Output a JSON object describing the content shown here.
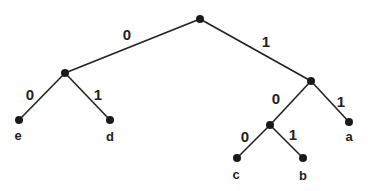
{
  "diagram": {
    "type": "binary-code-tree",
    "nodes": {
      "root": {
        "x": 200,
        "y": 19
      },
      "n0": {
        "x": 65,
        "y": 73
      },
      "n1": {
        "x": 311,
        "y": 81
      },
      "n10": {
        "x": 270,
        "y": 125
      },
      "e": {
        "x": 19,
        "y": 120,
        "label": "e"
      },
      "d": {
        "x": 110,
        "y": 120,
        "label": "d"
      },
      "a": {
        "x": 349,
        "y": 122,
        "label": "a"
      },
      "c": {
        "x": 237,
        "y": 158,
        "label": "c"
      },
      "b": {
        "x": 303,
        "y": 158,
        "label": "b"
      }
    },
    "edges": [
      {
        "from": "root",
        "to": "n0",
        "label": "0"
      },
      {
        "from": "root",
        "to": "n1",
        "label": "1"
      },
      {
        "from": "n0",
        "to": "e",
        "label": "0"
      },
      {
        "from": "n0",
        "to": "d",
        "label": "1"
      },
      {
        "from": "n1",
        "to": "n10",
        "label": "0"
      },
      {
        "from": "n1",
        "to": "a",
        "label": "1"
      },
      {
        "from": "n10",
        "to": "c",
        "label": "0"
      },
      {
        "from": "n10",
        "to": "b",
        "label": "1"
      }
    ],
    "edge_labels": {
      "root_n0": "0",
      "root_n1": "1",
      "n0_e": "0",
      "n0_d": "1",
      "n1_n10": "0",
      "n1_a": "1",
      "n10_c": "0",
      "n10_b": "1"
    },
    "leaf_labels": {
      "e": "e",
      "d": "d",
      "a": "a",
      "c": "c",
      "b": "b"
    }
  }
}
